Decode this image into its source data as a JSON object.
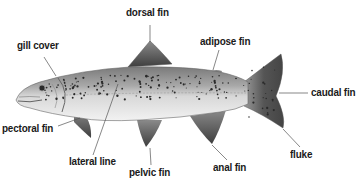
{
  "labels": {
    "dorsal_fin": "dorsal fin",
    "gill_cover": "gill cover",
    "adipose_fin": "adipose fin",
    "caudal_fin": "caudal fin",
    "pectoral_fin": "pectoral fin",
    "lateral_line": "lateral line",
    "pelvic_fin": "pelvic fin",
    "anal_fin": "anal fin",
    "fluke": "fluke"
  },
  "colors": {
    "text": "#1a1a1a",
    "leader": "#555555",
    "body_dark": "#6e6e6e",
    "body_light": "#e8e8e8",
    "fin": "#5a5a5a",
    "spots": "#2a2a2a"
  }
}
